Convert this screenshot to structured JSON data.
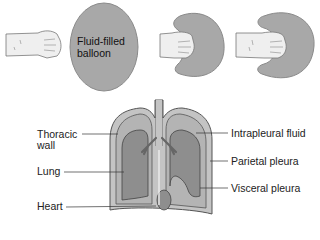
{
  "top_panel": {
    "balloon_label_line1": "Fluid-filled",
    "balloon_label_line2": "balloon",
    "stages": [
      {
        "name": "fist-approaching-balloon"
      },
      {
        "name": "fist-pressing-balloon"
      },
      {
        "name": "fist-enveloped-by-balloon"
      }
    ]
  },
  "bottom_panel": {
    "left_labels": {
      "thoracic_wall_line1": "Thoracic",
      "thoracic_wall_line2": "wall",
      "lung": "Lung",
      "heart": "Heart"
    },
    "right_labels": {
      "intrapleural_fluid": "Intrapleural fluid",
      "parietal_pleura": "Parietal pleura",
      "visceral_pleura": "Visceral pleura"
    }
  },
  "colors": {
    "balloon_fill": "#a8a8a8",
    "balloon_stroke": "#8a8a8a",
    "skin_fill": "#efefef",
    "skin_stroke": "#777777",
    "pleural_fill": "#b4b4b4",
    "lung_fill": "#8e8e8e",
    "outline": "#555555"
  }
}
